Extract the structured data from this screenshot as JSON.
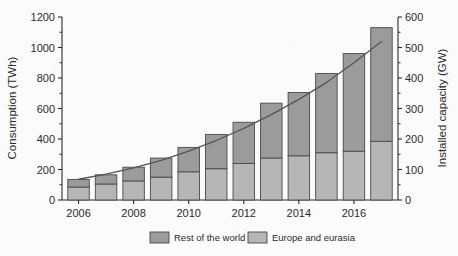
{
  "chart_data": {
    "type": "bar",
    "title": "",
    "subtitle": "",
    "xlabel": "",
    "ylabel": "Consumption (TWh)",
    "y2label": "Installed capacity (GW)",
    "categories": [
      "2006",
      "2007",
      "2008",
      "2009",
      "2010",
      "2011",
      "2012",
      "2013",
      "2014",
      "2015",
      "2016",
      "2017"
    ],
    "x": [
      2006,
      2007,
      2008,
      2009,
      2010,
      2011,
      2012,
      2013,
      2014,
      2015,
      2016,
      2017
    ],
    "series": [
      {
        "name": "Europe and eurasia",
        "type": "bar-segment",
        "axis": "left",
        "color": "#b6b6b6",
        "values": [
          85,
          105,
          125,
          150,
          185,
          205,
          240,
          275,
          290,
          310,
          320,
          385
        ]
      },
      {
        "name": "Rest of the world",
        "type": "bar-segment",
        "axis": "left",
        "color": "#9b9b9b",
        "values": [
          50,
          60,
          90,
          125,
          160,
          225,
          270,
          360,
          415,
          520,
          640,
          745
        ]
      },
      {
        "name": "Installed capacity",
        "type": "line",
        "axis": "right",
        "color": "#555555",
        "values": [
          68,
          85,
          105,
          130,
          160,
          195,
          235,
          280,
          330,
          385,
          450,
          520
        ]
      }
    ],
    "totals": [
      135,
      165,
      215,
      275,
      345,
      430,
      510,
      635,
      705,
      830,
      960,
      1130
    ],
    "yaxis": {
      "label": "Consumption (TWh)",
      "ticks": [
        0,
        200,
        400,
        600,
        800,
        1000,
        1200
      ],
      "tick_labels": [
        "0",
        "200",
        "400",
        "600",
        "800",
        "1000",
        "1200"
      ],
      "min": 0,
      "max": 1200,
      "minor_step": 100
    },
    "y2axis": {
      "label": "Installed capacity (GW)",
      "ticks": [
        0,
        100,
        200,
        300,
        400,
        500,
        600
      ],
      "tick_labels": [
        "0",
        "100",
        "200",
        "300",
        "400",
        "500",
        "600"
      ],
      "min": 0,
      "max": 600,
      "minor_step": 50
    },
    "xaxis": {
      "label": "",
      "ticks": [
        2006,
        2008,
        2010,
        2012,
        2014,
        2016
      ],
      "tick_labels": [
        "2006",
        "2008",
        "2010",
        "2012",
        "2014",
        "2016"
      ],
      "min": 2005.4,
      "max": 2017.6
    },
    "grid": false,
    "legend": {
      "position": "bottom",
      "entries": [
        {
          "label": "Rest of the world",
          "color": "#9b9b9b"
        },
        {
          "label": "Europe and eurasia",
          "color": "#b6b6b6"
        }
      ]
    }
  },
  "axes": {
    "y_title": "Consumption (TWh)",
    "y2_title": "Installed capacity (GW)",
    "y_ticks": [
      "0",
      "200",
      "400",
      "600",
      "800",
      "1000",
      "1200"
    ],
    "y2_ticks": [
      "0",
      "100",
      "200",
      "300",
      "400",
      "500",
      "600"
    ],
    "x_ticks": [
      "2006",
      "2008",
      "2010",
      "2012",
      "2014",
      "2016"
    ]
  },
  "legend": {
    "item0_label": "Rest of the world",
    "item1_label": "Europe and eurasia"
  },
  "colors": {
    "rest_of_world": "#9b9b9b",
    "europe_eurasia": "#b6b6b6",
    "line": "#555555",
    "axis": "#2b2b2b",
    "background": "#fbfbfb"
  }
}
